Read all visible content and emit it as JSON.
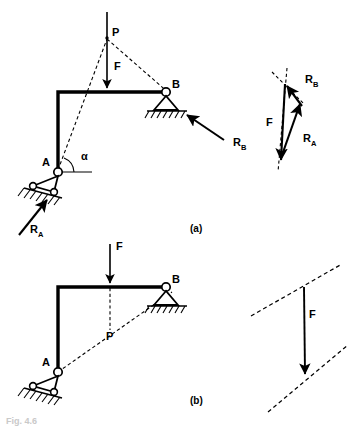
{
  "figure": {
    "title_caption": "Fig. 4.6",
    "parts": [
      {
        "key": "a",
        "label": "(a)"
      },
      {
        "key": "b",
        "label": "(b)"
      }
    ],
    "colors": {
      "ink": "#000000",
      "background": "#ffffff",
      "faint_caption": "#c9c9c9"
    }
  },
  "diagram_a": {
    "name": "three-force-member-frame-concurrent",
    "joints": [
      {
        "name": "A",
        "label": "A",
        "support": "rocker-pin-on-inclined-plane",
        "x": 58,
        "y": 172
      },
      {
        "name": "B",
        "label": "B",
        "support": "pin-triangle-on-ground",
        "x": 166,
        "y": 92
      }
    ],
    "concurrency_point": {
      "label": "P",
      "x": 107,
      "y": 38
    },
    "angle": {
      "label": "α",
      "vertex": "A",
      "between": [
        "line-AP",
        "horizontal"
      ],
      "x": 83,
      "y": 156
    },
    "forces": [
      {
        "label": "F",
        "sub": "",
        "direction": "vertical-down",
        "applied_at_x": 107,
        "description": "applied load on horizontal beam"
      },
      {
        "label": "R",
        "sub": "A",
        "direction": "up-and-right",
        "description": "reaction at support A along AP"
      },
      {
        "label": "R",
        "sub": "B",
        "direction": "up-and-left",
        "description": "reaction at support B along BP"
      }
    ],
    "members": [
      {
        "from": "A",
        "to": "corner",
        "type": "vertical-column"
      },
      {
        "from": "corner",
        "to": "B",
        "type": "horizontal-beam"
      }
    ],
    "construction_lines": [
      {
        "from": "A",
        "to": "P",
        "style": "dashed"
      },
      {
        "from": "B",
        "to": "P",
        "style": "dashed"
      }
    ]
  },
  "force_triangle_a": {
    "name": "closed-force-triangle",
    "vectors": [
      {
        "label": "F",
        "sub": "",
        "direction": "down",
        "label_x": 272,
        "label_y": 122
      },
      {
        "label": "R",
        "sub": "A",
        "direction": "up-right",
        "label_x": 313,
        "label_y": 141
      },
      {
        "label": "R",
        "sub": "B",
        "direction": "up-left",
        "label_x": 315,
        "label_y": 86
      }
    ],
    "guide_lines_style": "dashed"
  },
  "diagram_b": {
    "name": "frame-with-line-of-action-through-P",
    "joints": [
      {
        "name": "A",
        "label": "A",
        "support": "rocker-pin-on-inclined-plane",
        "x": 58,
        "y": 372
      },
      {
        "name": "B",
        "label": "B",
        "support": "pin-triangle-on-ground",
        "x": 166,
        "y": 287
      }
    ],
    "point": {
      "label": "P",
      "x": 110,
      "y": 332
    },
    "forces": [
      {
        "label": "F",
        "sub": "",
        "direction": "vertical-down",
        "applied_at_x": 110
      }
    ],
    "construction_lines": [
      {
        "from": "A",
        "to": "B",
        "style": "dashed",
        "description": "line of action through P"
      },
      {
        "from": "F-line",
        "to": "P",
        "style": "dashed",
        "description": "vertical line of F extended to P"
      }
    ]
  },
  "force_diagram_b": {
    "name": "parallel-lines-with-force",
    "vectors": [
      {
        "label": "F",
        "sub": "",
        "direction": "down",
        "label_x": 313,
        "label_y": 314
      }
    ],
    "guide_lines": [
      {
        "style": "dashed",
        "description": "upper parallel dashed line"
      },
      {
        "style": "dashed",
        "description": "lower parallel dashed line"
      }
    ]
  }
}
